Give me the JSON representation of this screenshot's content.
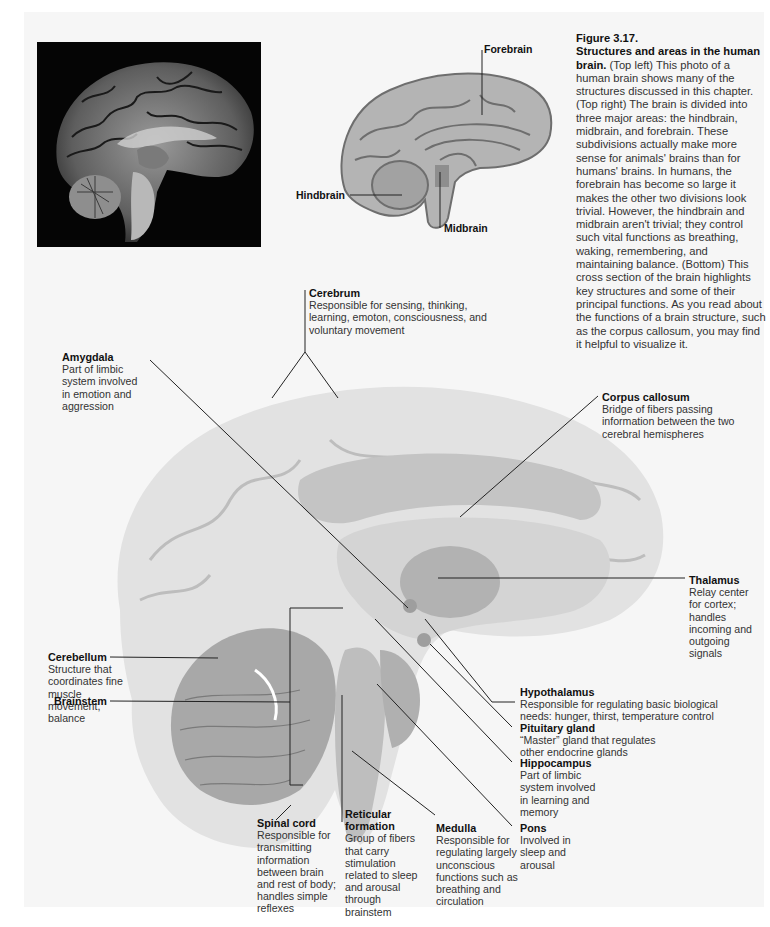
{
  "figure": {
    "number": "Figure 3.17.",
    "title": "Structures and areas in the human brain.",
    "caption_body": " (Top left) This photo of a human brain shows many of the structures discussed in this chapter. (Top right) The brain is divided into three major areas: the hindbrain, midbrain, and forebrain. These subdivisions actually make more sense for animals' brains than for humans' brains. In humans, the forebrain has become so large it makes the other two divisions look trivial. However, the hindbrain and midbrain aren't trivial; they control such vital functions as breathing, waking, remembering, and maintaining balance. (Bottom) This cross section of the brain highlights key structures and some of their principal functions. As you read about the functions of a brain structure, such as the corpus callosum, you may find it helpful to visualize it."
  },
  "top_right_diagram": {
    "labels": {
      "forebrain": "Forebrain",
      "hindbrain": "Hindbrain",
      "midbrain": "Midbrain"
    }
  },
  "colors": {
    "page_bg": "#f6f6f6",
    "photo_bg": "#050505",
    "diagram_fill": "#b4b4b4",
    "diagram_stroke": "#6e6e6e",
    "cross_section_light": "#e2e2e2",
    "cross_section_mid": "#c4c4c4",
    "cross_section_dark": "#a8a8a8",
    "leader_line": "#222222"
  },
  "structures": {
    "cerebrum": {
      "name": "Cerebrum",
      "desc": "Responsible for sensing, thinking, learning, emoton, consciousness, and voluntary movement"
    },
    "amygdala": {
      "name": "Amygdala",
      "desc": "Part of limbic system involved in emotion and aggression"
    },
    "corpus_callosum": {
      "name": "Corpus callosum",
      "desc": "Bridge of fibers passing information between the two cerebral hemispheres"
    },
    "thalamus": {
      "name": "Thalamus",
      "desc": "Relay center for cortex; handles incoming and outgoing signals"
    },
    "cerebellum": {
      "name": "Cerebellum",
      "desc": "Structure that coordinates fine muscle movement, balance"
    },
    "brainstem": {
      "name": "Brainstem"
    },
    "hypothalamus": {
      "name": "Hypothalamus",
      "desc": "Responsible for regulating basic biological needs: hunger, thirst, temperature control"
    },
    "pituitary": {
      "name": "Pituitary gland",
      "desc": "“Master” gland that regulates other endocrine glands"
    },
    "hippocampus": {
      "name": "Hippocampus",
      "desc": "Part of limbic system involved in learning and memory"
    },
    "spinal_cord": {
      "name": "Spinal cord",
      "desc": "Responsible for transmitting information between brain and rest of body; handles simple reflexes"
    },
    "reticular": {
      "name": "Reticular formation",
      "desc": "Group of fibers that carry stimulation related to sleep and arousal through brainstem"
    },
    "medulla": {
      "name": "Medulla",
      "desc": "Responsible for regulating largely unconscious functions such as breathing and circulation"
    },
    "pons": {
      "name": "Pons",
      "desc": "Involved in sleep and arousal"
    }
  }
}
